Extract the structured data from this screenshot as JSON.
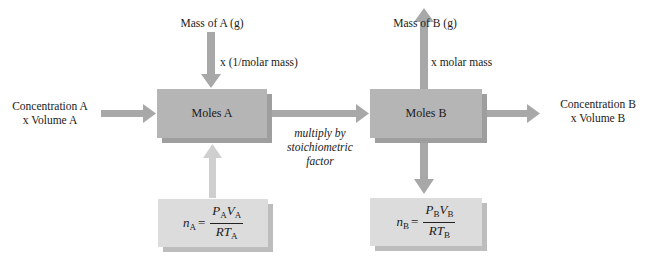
{
  "diagram": {
    "type": "flowchart",
    "colors": {
      "arrow": "#a8a8a8",
      "arrow_light": "#cfcfcf",
      "box": "#b5b5b5",
      "box_shadow": "#9e9e9e",
      "formula_box": "#dcdcdc",
      "formula_shadow": "#bdbdbd"
    },
    "nodes": {
      "moles_a": {
        "label": "Moles A"
      },
      "moles_b": {
        "label": "Moles B"
      },
      "formula_a": {
        "lhs": "n",
        "lhs_sub": "A",
        "eq": "=",
        "num_p": "P",
        "num_p_sub": "A",
        "num_v": "V",
        "num_v_sub": "A",
        "den_rt": "RT",
        "den_rt_sub": "A"
      },
      "formula_b": {
        "lhs": "n",
        "lhs_sub": "B",
        "eq": "=",
        "num_p": "P",
        "num_p_sub": "B",
        "num_v": "V",
        "num_v_sub": "B",
        "den_rt": "RT",
        "den_rt_sub": "B"
      }
    },
    "labels": {
      "mass_a": "Mass of A (g)",
      "mass_a_op": "x (1/molar mass)",
      "conc_a_line1": "Concentration A",
      "conc_a_line2": "x Volume A",
      "mass_b": "Mass of B (g)",
      "mass_b_op": "x molar mass",
      "conc_b_line1": "Concentration B",
      "conc_b_line2": "x Volume B",
      "stoich_line1": "multiply by",
      "stoich_line2": "stoichiometric",
      "stoich_line3": "factor"
    }
  }
}
